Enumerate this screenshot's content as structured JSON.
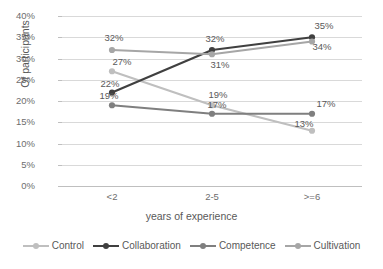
{
  "chart_data": {
    "type": "line",
    "title": "",
    "xlabel": "years of experience",
    "ylabel": "Of participants",
    "categories": [
      "<2",
      "2-5",
      ">=6"
    ],
    "ylim": [
      0,
      40
    ],
    "ytick_labels": [
      "0%",
      "5%",
      "10%",
      "15%",
      "20%",
      "25%",
      "30%",
      "35%",
      "40%"
    ],
    "ytick_values": [
      0,
      5,
      10,
      15,
      20,
      25,
      30,
      35,
      40
    ],
    "grid": true,
    "legend_position": "bottom",
    "series": [
      {
        "name": "Control",
        "color": "#bfbfbf",
        "values": [
          27,
          19,
          13
        ],
        "labels": [
          "27%",
          "19%",
          "13%"
        ]
      },
      {
        "name": "Collaboration",
        "color": "#404040",
        "values": [
          22,
          32,
          35
        ],
        "labels": [
          "22%",
          "32%",
          "35%"
        ]
      },
      {
        "name": "Competence",
        "color": "#7f7f7f",
        "values": [
          19,
          17,
          17
        ],
        "labels": [
          "19%",
          "17%",
          "17%"
        ]
      },
      {
        "name": "Cultivation",
        "color": "#a6a6a6",
        "values": [
          32,
          31,
          34
        ],
        "labels": [
          "32%",
          "31%",
          "34%"
        ]
      }
    ]
  },
  "axes": {
    "y_title": "Of participants",
    "x_title": "years of experience",
    "y_ticks": [
      {
        "label": "40%"
      },
      {
        "label": "35%"
      },
      {
        "label": "30%"
      },
      {
        "label": "25%"
      },
      {
        "label": "20%"
      },
      {
        "label": "15%"
      },
      {
        "label": "10%"
      },
      {
        "label": "5%"
      },
      {
        "label": "0%"
      }
    ],
    "x_ticks": [
      {
        "label": "<2"
      },
      {
        "label": "2-5"
      },
      {
        "label": ">=6"
      }
    ]
  },
  "legend": {
    "items": [
      {
        "label": "Control"
      },
      {
        "label": "Collaboration"
      },
      {
        "label": "Competence"
      },
      {
        "label": "Cultivation"
      }
    ]
  },
  "data_labels": [
    {
      "text": "32%"
    },
    {
      "text": "27%"
    },
    {
      "text": "23%"
    },
    {
      "text": "22%"
    },
    {
      "text": "19%"
    },
    {
      "text": "18%"
    },
    {
      "text": "32%"
    },
    {
      "text": "31%"
    },
    {
      "text": "19%"
    },
    {
      "text": "17%"
    },
    {
      "text": "35%"
    },
    {
      "text": "34%"
    },
    {
      "text": "17%"
    },
    {
      "text": "13%"
    }
  ]
}
